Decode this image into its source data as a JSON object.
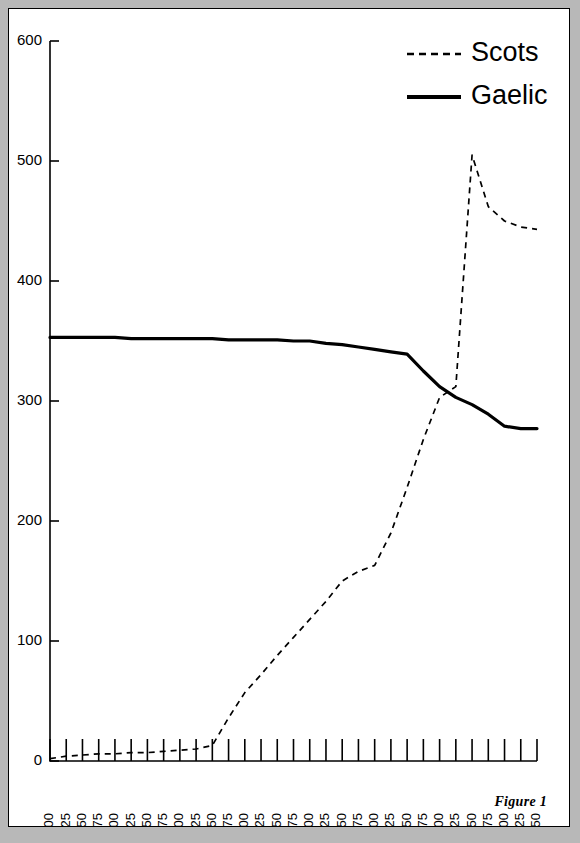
{
  "figure": {
    "caption": "Figure 1"
  },
  "chart_data": {
    "type": "line",
    "title": "",
    "subtitle": "",
    "xlabel": "",
    "ylabel": "",
    "xlim": [
      1200,
      1950
    ],
    "ylim": [
      0,
      600
    ],
    "grid": false,
    "legend_position": "top-right",
    "y_ticks": [
      0,
      100,
      200,
      300,
      400,
      500,
      600
    ],
    "y_tick_labels": [
      "0",
      "100",
      "200",
      "300",
      "400",
      "500",
      "600"
    ],
    "x_ticks": [
      1200,
      1225,
      1250,
      1275,
      1300,
      1325,
      1350,
      1375,
      1400,
      1425,
      1450,
      1475,
      1500,
      1525,
      1550,
      1575,
      1600,
      1625,
      1650,
      1675,
      1700,
      1725,
      1750,
      1775,
      1800,
      1825,
      1850,
      1875,
      1900,
      1925,
      1950
    ],
    "x_tick_labels": [
      "1200",
      "1225",
      "1250",
      "1275",
      "1300",
      "1325",
      "1350",
      "1375",
      "1400",
      "1425",
      "1450",
      "1475",
      "1500",
      "1525",
      "1550",
      "1575",
      "1600",
      "1625",
      "1650",
      "1675",
      "1700",
      "1725",
      "1750",
      "1775",
      "1800",
      "1825",
      "1850",
      "1875",
      "1900",
      "1925",
      "1950"
    ],
    "series": [
      {
        "name": "Scots",
        "style": "dashed",
        "color": "#000000",
        "x": [
          1200,
          1225,
          1250,
          1275,
          1300,
          1325,
          1350,
          1375,
          1400,
          1425,
          1450,
          1475,
          1500,
          1525,
          1550,
          1575,
          1600,
          1625,
          1650,
          1675,
          1700,
          1725,
          1750,
          1775,
          1800,
          1825,
          1850,
          1875,
          1900,
          1925,
          1950
        ],
        "values": [
          2,
          4,
          5,
          6,
          6,
          7,
          7,
          8,
          9,
          10,
          13,
          36,
          57,
          72,
          88,
          103,
          118,
          133,
          150,
          158,
          163,
          190,
          228,
          268,
          303,
          312,
          505,
          462,
          450,
          445,
          443
        ]
      },
      {
        "name": "Gaelic",
        "style": "solid",
        "color": "#000000",
        "x": [
          1200,
          1225,
          1250,
          1275,
          1300,
          1325,
          1350,
          1375,
          1400,
          1425,
          1450,
          1475,
          1500,
          1525,
          1550,
          1575,
          1600,
          1625,
          1650,
          1675,
          1700,
          1725,
          1750,
          1775,
          1800,
          1825,
          1850,
          1875,
          1900,
          1925,
          1950
        ],
        "values": [
          353,
          353,
          353,
          353,
          353,
          352,
          352,
          352,
          352,
          352,
          352,
          351,
          351,
          351,
          351,
          350,
          350,
          348,
          347,
          345,
          343,
          341,
          339,
          325,
          312,
          303,
          297,
          289,
          279,
          277,
          277
        ]
      }
    ]
  },
  "legend": {
    "items": [
      {
        "label": "Scots",
        "style": "dashed"
      },
      {
        "label": "Gaelic",
        "style": "solid"
      }
    ]
  }
}
